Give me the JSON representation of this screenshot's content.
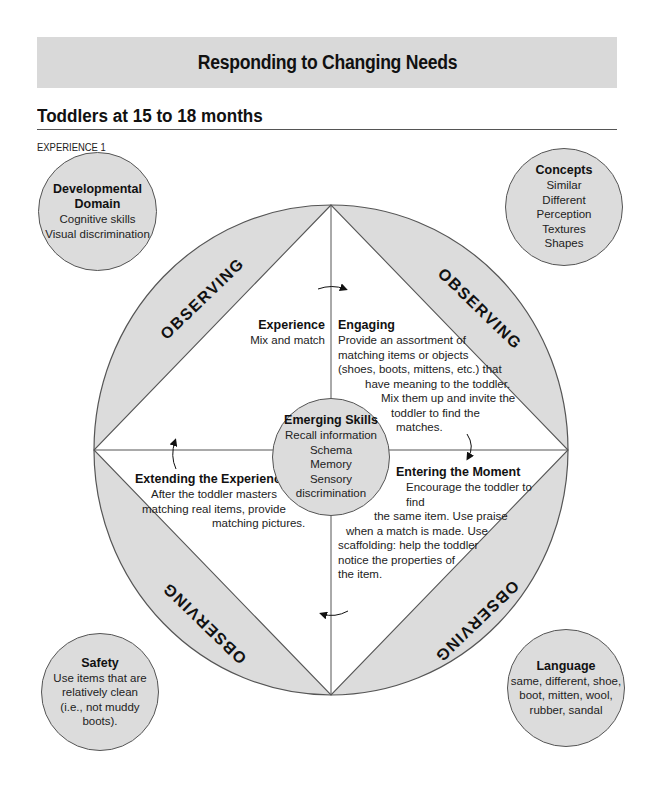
{
  "header": {
    "banner_title": "Responding to Changing Needs",
    "section_title": "Toddlers at 15 to 18 months",
    "experience_label": "EXPERIENCE 1"
  },
  "colors": {
    "banner_bg": "#d9d9d9",
    "shaded_region": "#dcdcdc",
    "outline": "#555555"
  },
  "corner_bubbles": {
    "developmental_domain": {
      "title_line1": "Developmental",
      "title_line2": "Domain",
      "lines": [
        "Cognitive skills",
        "Visual discrimination"
      ]
    },
    "concepts": {
      "title": "Concepts",
      "lines": [
        "Similar",
        "Different",
        "Perception",
        "Textures",
        "Shapes"
      ]
    },
    "safety": {
      "title": "Safety",
      "lines": [
        "Use items that are",
        "relatively clean",
        "(i.e., not muddy",
        "boots)."
      ]
    },
    "language": {
      "title": "Language",
      "lines": [
        "same, different, shoe,",
        "boot, mitten, wool,",
        "rubber, sandal"
      ]
    }
  },
  "ring_labels": {
    "top_left": "OBSERVING",
    "top_right": "OBSERVING",
    "bottom_left": "OBSERVING",
    "bottom_right": "OBSERVING"
  },
  "quadrants": {
    "experience": {
      "title": "Experience",
      "lines": [
        "Mix and match"
      ]
    },
    "engaging": {
      "title": "Engaging",
      "lines": [
        "Provide an assortment of",
        "matching items or objects",
        "(shoes, boots, mittens, etc.) that",
        "have meaning to the toddler.",
        "Mix them up and invite the",
        "toddler to find the",
        "matches."
      ]
    },
    "entering_the_moment": {
      "title": "Entering the Moment",
      "lines": [
        "Encourage the toddler to find",
        "the same item. Use praise",
        "when a match is made. Use",
        "scaffolding: help the toddler",
        "notice the properties of",
        "the item."
      ]
    },
    "extending_the_experience": {
      "title": "Extending the Experience",
      "lines": [
        "After the toddler masters",
        "matching real items, provide",
        "matching pictures."
      ]
    }
  },
  "center_bubble": {
    "title": "Emerging Skills",
    "lines": [
      "Recall information",
      "Schema",
      "Memory",
      "Sensory",
      "discrimination"
    ]
  },
  "icons": {
    "cycle_arrows": [
      "arrow-top-clockwise",
      "arrow-right-clockwise",
      "arrow-bottom-clockwise",
      "arrow-left-clockwise"
    ]
  }
}
